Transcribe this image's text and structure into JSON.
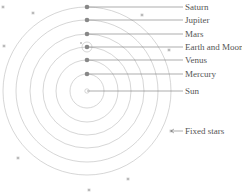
{
  "diagram": {
    "center": {
      "x": 87,
      "y": 91
    },
    "orbits": [
      {
        "name": "Mercury",
        "radius": 17
      },
      {
        "name": "Venus",
        "radius": 31
      },
      {
        "name": "Earth and Moon",
        "radius": 44
      },
      {
        "name": "Mars",
        "radius": 57
      },
      {
        "name": "Jupiter",
        "radius": 71
      },
      {
        "name": "Saturn",
        "radius": 84
      }
    ],
    "labels": [
      {
        "id": "saturn",
        "text": "Saturn",
        "y": 7
      },
      {
        "id": "jupiter",
        "text": "Jupiter",
        "y": 20
      },
      {
        "id": "mars",
        "text": "Mars",
        "y": 34
      },
      {
        "id": "earth",
        "text": "Earth and Moon",
        "y": 47
      },
      {
        "id": "venus",
        "text": "Venus",
        "y": 60
      },
      {
        "id": "mercury",
        "text": "Mercury",
        "y": 74
      },
      {
        "id": "sun",
        "text": "Sun",
        "y": 91
      }
    ],
    "fixed_stars_label": "Fixed stars",
    "stars": [
      {
        "x": 3,
        "y": 7
      },
      {
        "x": 33,
        "y": 13
      },
      {
        "x": 142,
        "y": 15
      },
      {
        "x": 4,
        "y": 46
      },
      {
        "x": 169,
        "y": 50
      },
      {
        "x": 171,
        "y": 131
      },
      {
        "x": 18,
        "y": 158
      },
      {
        "x": 128,
        "y": 179
      },
      {
        "x": 89,
        "y": 190
      }
    ],
    "colors": {
      "orbit": "#bbbbbb",
      "planet": "#888888",
      "leader": "#777777",
      "star": "#999999",
      "text": "#555555"
    }
  }
}
